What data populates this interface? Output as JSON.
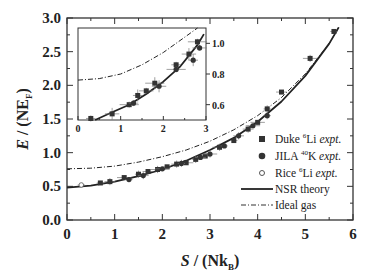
{
  "chart_data": [
    {
      "type": "scatter",
      "panel": "main",
      "title": "",
      "xlabel": "S / (Nk_B)",
      "ylabel": "E / (NE_F)",
      "xlim": [
        0,
        6
      ],
      "ylim": [
        0,
        3.0
      ],
      "xticks": [
        "0",
        "1",
        "2",
        "3",
        "4",
        "5",
        "6"
      ],
      "yticks": [
        "0.0",
        "0.5",
        "1.0",
        "1.5",
        "2.0",
        "2.5",
        "3.0"
      ],
      "grid": false,
      "legend_position": "lower right",
      "legend": [
        {
          "label": "Duke 6Li expt.",
          "marker": "square"
        },
        {
          "label": "JILA 40K expt.",
          "marker": "filled-circle"
        },
        {
          "label": "Rice 6Li expt.",
          "marker": "open-circle"
        },
        {
          "label": "NSR theory",
          "style": "solid-line"
        },
        {
          "label": "Ideal gas",
          "style": "dash-dot-line"
        }
      ],
      "series": [
        {
          "name": "Duke 6Li expt.",
          "x": [
            0.7,
            0.9,
            1.2,
            1.5,
            1.7,
            1.9,
            2.1,
            2.3,
            2.5,
            2.7,
            2.9,
            3.2,
            3.5,
            3.8,
            4.0,
            4.2,
            4.5,
            5.1,
            5.6
          ],
          "y": [
            0.55,
            0.57,
            0.63,
            0.68,
            0.72,
            0.75,
            0.79,
            0.83,
            0.85,
            0.9,
            0.95,
            1.08,
            1.18,
            1.35,
            1.45,
            1.65,
            1.9,
            2.4,
            2.8
          ]
        },
        {
          "name": "JILA 40K expt.",
          "x": [
            1.3,
            1.6,
            2.0,
            2.4,
            2.8,
            3.0,
            3.3,
            3.6,
            3.9,
            4.2
          ],
          "y": [
            0.6,
            0.66,
            0.76,
            0.84,
            0.93,
            0.98,
            1.1,
            1.25,
            1.4,
            1.55
          ]
        },
        {
          "name": "Rice 6Li expt.",
          "x": [
            0.3
          ],
          "y": [
            0.52
          ]
        },
        {
          "name": "NSR theory",
          "x": [
            0,
            0.5,
            1,
            1.5,
            2,
            2.5,
            3,
            3.5,
            4,
            4.5,
            5,
            5.5,
            5.7
          ],
          "y": [
            0.48,
            0.51,
            0.57,
            0.65,
            0.75,
            0.88,
            1.04,
            1.22,
            1.46,
            1.76,
            2.14,
            2.62,
            2.86
          ]
        },
        {
          "name": "Ideal gas",
          "x": [
            0,
            0.5,
            1,
            1.5,
            2,
            2.5,
            3,
            3.5,
            4,
            4.5,
            5,
            5.5,
            5.7
          ],
          "y": [
            0.76,
            0.77,
            0.8,
            0.86,
            0.94,
            1.04,
            1.17,
            1.34,
            1.55,
            1.82,
            2.17,
            2.62,
            2.86
          ]
        }
      ]
    },
    {
      "type": "scatter",
      "panel": "inset",
      "xlim": [
        0,
        3
      ],
      "ylim": [
        0.5,
        1.1
      ],
      "xticks": [
        "0",
        "1",
        "2",
        "3"
      ],
      "yticks": [
        "0.6",
        "0.8",
        "1.0"
      ],
      "series": [
        {
          "name": "Duke 6Li expt.",
          "x": [
            0.3,
            0.8,
            1.2,
            1.4,
            1.6,
            1.8,
            2.3,
            2.6,
            2.8
          ],
          "y": [
            0.51,
            0.54,
            0.6,
            0.66,
            0.69,
            0.74,
            0.86,
            0.93,
            1.01
          ]
        },
        {
          "name": "JILA 40K expt.",
          "x": [
            1.3,
            1.9,
            2.3,
            2.7,
            2.85
          ],
          "y": [
            0.61,
            0.72,
            0.83,
            0.89,
            0.97
          ]
        },
        {
          "name": "NSR theory",
          "x": [
            0.4,
            0.8,
            1.2,
            1.6,
            2.0,
            2.4,
            2.8,
            2.95
          ],
          "y": [
            0.5,
            0.55,
            0.6,
            0.67,
            0.75,
            0.85,
            0.99,
            1.06
          ]
        },
        {
          "name": "Ideal gas",
          "x": [
            0,
            0.5,
            1.0,
            1.5,
            2.0,
            2.5,
            2.8
          ],
          "y": [
            0.76,
            0.77,
            0.8,
            0.86,
            0.94,
            1.04,
            1.1
          ]
        }
      ]
    }
  ],
  "labels": {
    "ylabel_main": "E",
    "ylabel_rest": " / (NE",
    "ylabel_sub": "F",
    "ylabel_close": ")",
    "xlabel_main": "S",
    "xlabel_rest": " / (Nk",
    "xlabel_sub": "B",
    "xlabel_close": ")"
  },
  "legend": {
    "duke": {
      "name": "Duke ",
      "sup": "6",
      "el": "Li ",
      "expt": "expt."
    },
    "jila": {
      "name": "JILA ",
      "sup": "40",
      "el": "K ",
      "expt": "expt."
    },
    "rice": {
      "name": "Rice ",
      "sup": "6",
      "el": "Li ",
      "expt": "expt."
    },
    "nsr": "NSR theory",
    "ideal": "Ideal gas"
  }
}
